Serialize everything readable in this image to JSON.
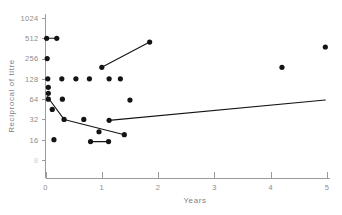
{
  "chart_data": {
    "type": "scatter",
    "title": "",
    "subtitle": "",
    "xlabel": "Years",
    "ylabel": "Reciprocal of titre",
    "xlim": [
      0,
      5
    ],
    "ylim": [
      8,
      1024
    ],
    "yscale": "log2",
    "grid": false,
    "legend": null,
    "xticks": [
      0,
      1,
      2,
      3,
      4,
      5
    ],
    "xticklabels": [
      "0",
      "1",
      "2",
      "3",
      "4",
      "5"
    ],
    "yticks": [
      8,
      16,
      32,
      64,
      128,
      256,
      512,
      1024
    ],
    "yticklabels": [
      "8",
      "16",
      "32",
      "64",
      "128",
      "256",
      "512",
      "1024"
    ],
    "points": [
      {
        "x": 0.02,
        "y": 512
      },
      {
        "x": 0.2,
        "y": 512
      },
      {
        "x": 0.03,
        "y": 256
      },
      {
        "x": 0.04,
        "y": 128
      },
      {
        "x": 0.29,
        "y": 128
      },
      {
        "x": 0.54,
        "y": 128
      },
      {
        "x": 0.78,
        "y": 128
      },
      {
        "x": 1.13,
        "y": 128
      },
      {
        "x": 1.33,
        "y": 128
      },
      {
        "x": 0.05,
        "y": 96
      },
      {
        "x": 0.05,
        "y": 78
      },
      {
        "x": 0.05,
        "y": 64
      },
      {
        "x": 0.3,
        "y": 64
      },
      {
        "x": 0.12,
        "y": 45
      },
      {
        "x": 0.33,
        "y": 32
      },
      {
        "x": 0.68,
        "y": 32
      },
      {
        "x": 1.13,
        "y": 31
      },
      {
        "x": 0.95,
        "y": 21
      },
      {
        "x": 1.4,
        "y": 19
      },
      {
        "x": 0.15,
        "y": 16
      },
      {
        "x": 0.8,
        "y": 15
      },
      {
        "x": 1.12,
        "y": 15
      },
      {
        "x": 1.0,
        "y": 190
      },
      {
        "x": 1.85,
        "y": 450
      },
      {
        "x": 1.5,
        "y": 62
      },
      {
        "x": 4.2,
        "y": 190
      },
      {
        "x": 4.97,
        "y": 380
      }
    ],
    "lines": [
      {
        "name": "short-segment-512",
        "from": {
          "x": 0.02,
          "y": 512
        },
        "to": {
          "x": 0.2,
          "y": 512
        }
      },
      {
        "name": "rising-segment-upper",
        "from": {
          "x": 1.0,
          "y": 190
        },
        "to": {
          "x": 1.85,
          "y": 450
        }
      },
      {
        "name": "falling-segment-left",
        "from": {
          "x": 0.03,
          "y": 70
        },
        "to": {
          "x": 0.33,
          "y": 32
        }
      },
      {
        "name": "declining-segment-mid",
        "from": {
          "x": 0.33,
          "y": 32
        },
        "to": {
          "x": 1.4,
          "y": 19
        }
      },
      {
        "name": "rising-segment-lower",
        "from": {
          "x": 1.13,
          "y": 31
        },
        "to": {
          "x": 4.97,
          "y": 62
        }
      },
      {
        "name": "short-segment-16",
        "from": {
          "x": 0.8,
          "y": 15
        },
        "to": {
          "x": 1.12,
          "y": 15
        }
      }
    ]
  }
}
